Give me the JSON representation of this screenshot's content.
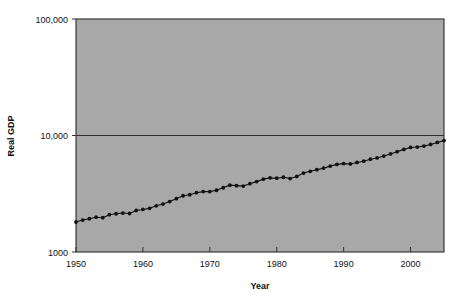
{
  "chart_data": {
    "type": "line",
    "title": "",
    "xlabel": "Year",
    "ylabel": "Real GDP",
    "yscale": "log",
    "ylim": [
      1000,
      100000
    ],
    "xlim": [
      1950,
      2005
    ],
    "grid": "horizontal-gridline-at-10000",
    "legend": "none",
    "marker": "filled-circle",
    "line_color": "#111111",
    "plot_background": "#a8a8a8",
    "figure_background": "#ffffff",
    "ytick_labels": [
      "1000",
      "10,000",
      "100,000"
    ],
    "ytick_values": [
      1000,
      10000,
      100000
    ],
    "xtick_labels": [
      "1950",
      "1960",
      "1970",
      "1980",
      "1990",
      "2000"
    ],
    "xtick_values": [
      1950,
      1960,
      1970,
      1980,
      1990,
      2000
    ],
    "x": [
      1950,
      1951,
      1952,
      1953,
      1954,
      1955,
      1956,
      1957,
      1958,
      1959,
      1960,
      1961,
      1962,
      1963,
      1964,
      1965,
      1966,
      1967,
      1968,
      1969,
      1970,
      1971,
      1972,
      1973,
      1974,
      1975,
      1976,
      1977,
      1978,
      1979,
      1980,
      1981,
      1982,
      1983,
      1984,
      1985,
      1986,
      1987,
      1988,
      1989,
      1990,
      1991,
      1992,
      1993,
      1994,
      1995,
      1996,
      1997,
      1998,
      1999,
      2000,
      2001,
      2002,
      2003,
      2004,
      2005
    ],
    "values": [
      1810,
      1880,
      1930,
      1990,
      1970,
      2090,
      2130,
      2160,
      2140,
      2270,
      2320,
      2370,
      2490,
      2580,
      2710,
      2870,
      3040,
      3100,
      3230,
      3300,
      3300,
      3390,
      3560,
      3750,
      3710,
      3680,
      3860,
      4020,
      4220,
      4330,
      4300,
      4380,
      4270,
      4450,
      4760,
      4930,
      5090,
      5250,
      5460,
      5650,
      5740,
      5700,
      5870,
      6020,
      6260,
      6420,
      6660,
      6950,
      7260,
      7600,
      7900,
      7960,
      8110,
      8380,
      8720,
      9040
    ]
  },
  "axes": {
    "ylabel": "Real GDP",
    "xlabel": "Year"
  }
}
